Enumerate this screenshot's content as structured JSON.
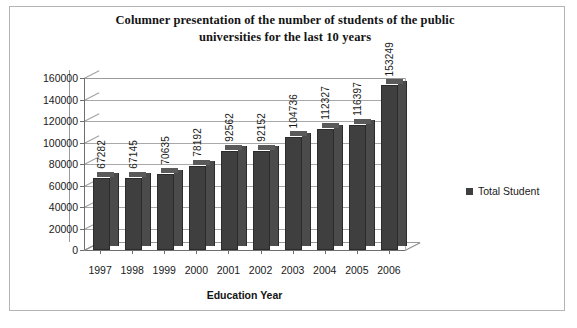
{
  "chart_data": {
    "type": "bar",
    "title": "Columner presentation of the number of students of the public universities for the last 10 years",
    "title_line1": "Columner presentation of the number of students of the public",
    "title_line2": "universities for the last 10 years",
    "xlabel": "Education Year",
    "ylabel": "",
    "categories": [
      "1997",
      "1998",
      "1999",
      "2000",
      "2001",
      "2002",
      "2003",
      "2004",
      "2005",
      "2006"
    ],
    "values": [
      67282,
      67145,
      70635,
      78192,
      92562,
      92152,
      104736,
      112327,
      116397,
      153249
    ],
    "data_labels": [
      "67282",
      "67145",
      "70635",
      "78192",
      "92562",
      "92152",
      "104736",
      "112327",
      "116397",
      "153249"
    ],
    "series": [
      {
        "name": "Total Student",
        "values": [
          67282,
          67145,
          70635,
          78192,
          92562,
          92152,
          104736,
          112327,
          116397,
          153249
        ]
      }
    ],
    "ylim": [
      0,
      160000
    ],
    "ytick_step": 20000,
    "yticks": [
      "0",
      "20000",
      "40000",
      "60000",
      "80000",
      "100000",
      "120000",
      "140000",
      "160000"
    ],
    "ytick_values": [
      0,
      20000,
      40000,
      60000,
      80000,
      100000,
      120000,
      140000,
      160000
    ],
    "grid": true,
    "grid_axis": "y",
    "legend_position": "right",
    "legend": [
      "Total Student"
    ],
    "bar_color": "#3f3f3f",
    "style": "3d-column"
  },
  "legend": {
    "label": "Total Student",
    "swatch_name": "legend-swatch-total-student"
  }
}
